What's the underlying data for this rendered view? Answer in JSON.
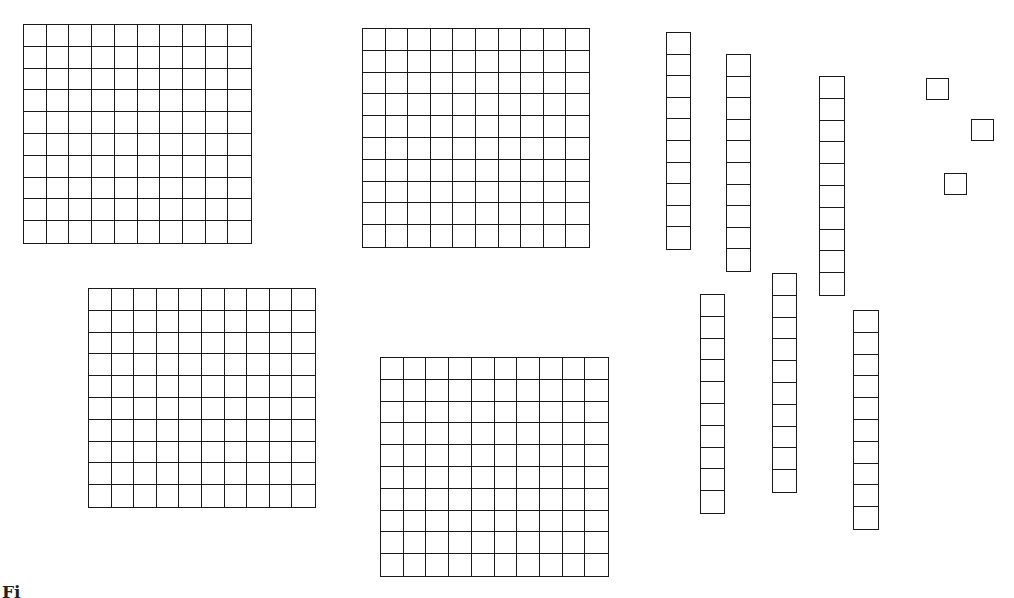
{
  "diagram": {
    "type": "base-ten-blocks",
    "line_color": "#1a1a1a",
    "background": "#ffffff",
    "caption_partial": "Fi",
    "counts": {
      "hundreds_flats": 4,
      "tens_rods": 6,
      "unit_cubes": 3
    },
    "represented_value": 463,
    "flats": [
      {
        "id": "flat-1",
        "rows": 10,
        "cols": 10,
        "x": 23,
        "y": 24,
        "w": 229,
        "h": 220
      },
      {
        "id": "flat-2",
        "rows": 10,
        "cols": 10,
        "x": 362,
        "y": 28,
        "w": 228,
        "h": 220
      },
      {
        "id": "flat-3",
        "rows": 10,
        "cols": 10,
        "x": 88,
        "y": 288,
        "w": 228,
        "h": 220
      },
      {
        "id": "flat-4",
        "rows": 10,
        "cols": 10,
        "x": 380,
        "y": 357,
        "w": 229,
        "h": 220
      }
    ],
    "rods": [
      {
        "id": "rod-1",
        "cells": 10,
        "x": 666,
        "y": 32,
        "w": 25,
        "h": 218
      },
      {
        "id": "rod-2",
        "cells": 10,
        "x": 726,
        "y": 54,
        "w": 25,
        "h": 218
      },
      {
        "id": "rod-3",
        "cells": 10,
        "x": 819,
        "y": 76,
        "w": 26,
        "h": 220
      },
      {
        "id": "rod-4",
        "cells": 10,
        "x": 700,
        "y": 294,
        "w": 25,
        "h": 220
      },
      {
        "id": "rod-5",
        "cells": 10,
        "x": 772,
        "y": 273,
        "w": 25,
        "h": 220
      },
      {
        "id": "rod-6",
        "cells": 10,
        "x": 853,
        "y": 310,
        "w": 26,
        "h": 220
      }
    ],
    "units": [
      {
        "id": "unit-1",
        "x": 926,
        "y": 78,
        "w": 23,
        "h": 22
      },
      {
        "id": "unit-2",
        "x": 971,
        "y": 119,
        "w": 23,
        "h": 22
      },
      {
        "id": "unit-3",
        "x": 944,
        "y": 173,
        "w": 23,
        "h": 22
      }
    ]
  }
}
